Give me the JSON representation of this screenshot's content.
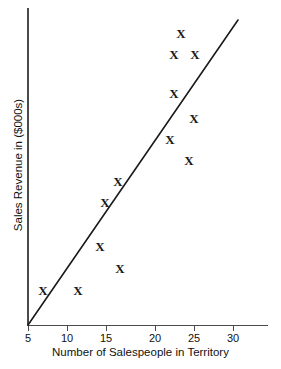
{
  "chart_data": {
    "type": "scatter",
    "title": "",
    "xlabel": "Number of Salespeople in Territory",
    "ylabel": "Sales Revenue in ($000s)",
    "xlim": [
      5,
      31
    ],
    "ylim": [
      0,
      100
    ],
    "grid": false,
    "legend": null,
    "marker_glyph": "X",
    "xticks": [
      {
        "value": 5,
        "label": "5",
        "px": 28
      },
      {
        "value": 10,
        "label": "10",
        "px": 67
      },
      {
        "value": 15,
        "label": "15",
        "px": 106
      },
      {
        "value": 20,
        "label": "20",
        "px": 155
      },
      {
        "value": 25,
        "label": "25",
        "px": 194
      },
      {
        "value": 30,
        "label": "30",
        "px": 233
      }
    ],
    "yticks": [],
    "points": [
      {
        "x": 7,
        "y": 11,
        "px": 43,
        "py": 290
      },
      {
        "x": 11,
        "y": 11,
        "px": 78,
        "py": 290
      },
      {
        "x": 14,
        "y": 25,
        "px": 100,
        "py": 246
      },
      {
        "x": 16,
        "y": 18,
        "px": 120,
        "py": 268
      },
      {
        "x": 16,
        "y": 39,
        "px": 105,
        "py": 202
      },
      {
        "x": 17,
        "y": 46,
        "px": 118,
        "py": 181
      },
      {
        "x": 22,
        "y": 53,
        "px": 170,
        "py": 139
      },
      {
        "x": 23,
        "y": 66,
        "px": 174,
        "py": 93
      },
      {
        "x": 23,
        "y": 79,
        "px": 174,
        "py": 54
      },
      {
        "x": 23,
        "y": 86,
        "px": 181,
        "py": 33
      },
      {
        "x": 24,
        "y": 46,
        "px": 189,
        "py": 160
      },
      {
        "x": 25,
        "y": 61,
        "px": 194,
        "py": 118
      },
      {
        "x": 25,
        "y": 79,
        "px": 195,
        "py": 54
      }
    ],
    "trend_line": {
      "label": "fitted regression line",
      "start": {
        "x": 5,
        "y": 0,
        "px": 28,
        "py": 325
      },
      "end": {
        "x": 30,
        "y": 100,
        "px": 238,
        "py": 20
      },
      "color": "#1a1a1a"
    },
    "colors": {
      "axis": "#4a4a4a",
      "marker": "#1a1a1a",
      "line": "#1a1a1a",
      "background": "#ffffff",
      "text": "#111111"
    }
  }
}
